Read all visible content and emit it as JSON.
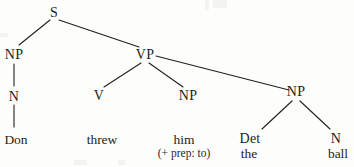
{
  "figure": {
    "type": "syntax-tree",
    "background_color": "#fdfdfc",
    "ink_color": "#231f20",
    "sentence": "Don threw him the ball"
  },
  "nodes": {
    "s": {
      "label": "S",
      "x": 54,
      "y": 6
    },
    "np_subject": {
      "label": "NP",
      "x": 14,
      "y": 48
    },
    "n_subject": {
      "label": "N",
      "x": 14,
      "y": 90
    },
    "vp": {
      "label": "VP",
      "x": 145,
      "y": 48
    },
    "v": {
      "label": "V",
      "x": 99,
      "y": 89
    },
    "np_object1": {
      "label": "NP",
      "x": 188,
      "y": 89
    },
    "np_object2": {
      "label": "NP",
      "x": 296,
      "y": 85
    },
    "det": {
      "label": "Det",
      "x": 250,
      "y": 132
    },
    "n_object": {
      "label": "N",
      "x": 336,
      "y": 132
    }
  },
  "leaves": {
    "don": {
      "label": "Don",
      "x": 16,
      "y": 133
    },
    "threw": {
      "label": "threw",
      "x": 102,
      "y": 133
    },
    "him": {
      "label": "him",
      "x": 184,
      "y": 133
    },
    "him_feature": {
      "label": "(+ prep: to)",
      "x": 184,
      "y": 148
    },
    "the": {
      "label": "the",
      "x": 249,
      "y": 147
    },
    "ball": {
      "label": "ball",
      "x": 338,
      "y": 147
    }
  },
  "edges": [
    {
      "name": "s-to-np-subject",
      "x1": 50,
      "y1": 20,
      "x2": 19,
      "y2": 45
    },
    {
      "name": "s-to-vp",
      "x1": 59,
      "y1": 20,
      "x2": 139,
      "y2": 47
    },
    {
      "name": "np-subject-to-n",
      "x1": 14,
      "y1": 64,
      "x2": 14,
      "y2": 86
    },
    {
      "name": "n-to-don",
      "x1": 14,
      "y1": 105,
      "x2": 14,
      "y2": 127
    },
    {
      "name": "vp-to-v",
      "x1": 141,
      "y1": 63,
      "x2": 104,
      "y2": 87
    },
    {
      "name": "vp-to-np-object1",
      "x1": 149,
      "y1": 63,
      "x2": 183,
      "y2": 87
    },
    {
      "name": "vp-to-np-object2",
      "x1": 156,
      "y1": 56,
      "x2": 289,
      "y2": 90
    },
    {
      "name": "np-object2-to-det",
      "x1": 292,
      "y1": 101,
      "x2": 262,
      "y2": 129
    },
    {
      "name": "np-object2-to-n",
      "x1": 300,
      "y1": 101,
      "x2": 330,
      "y2": 129
    }
  ]
}
